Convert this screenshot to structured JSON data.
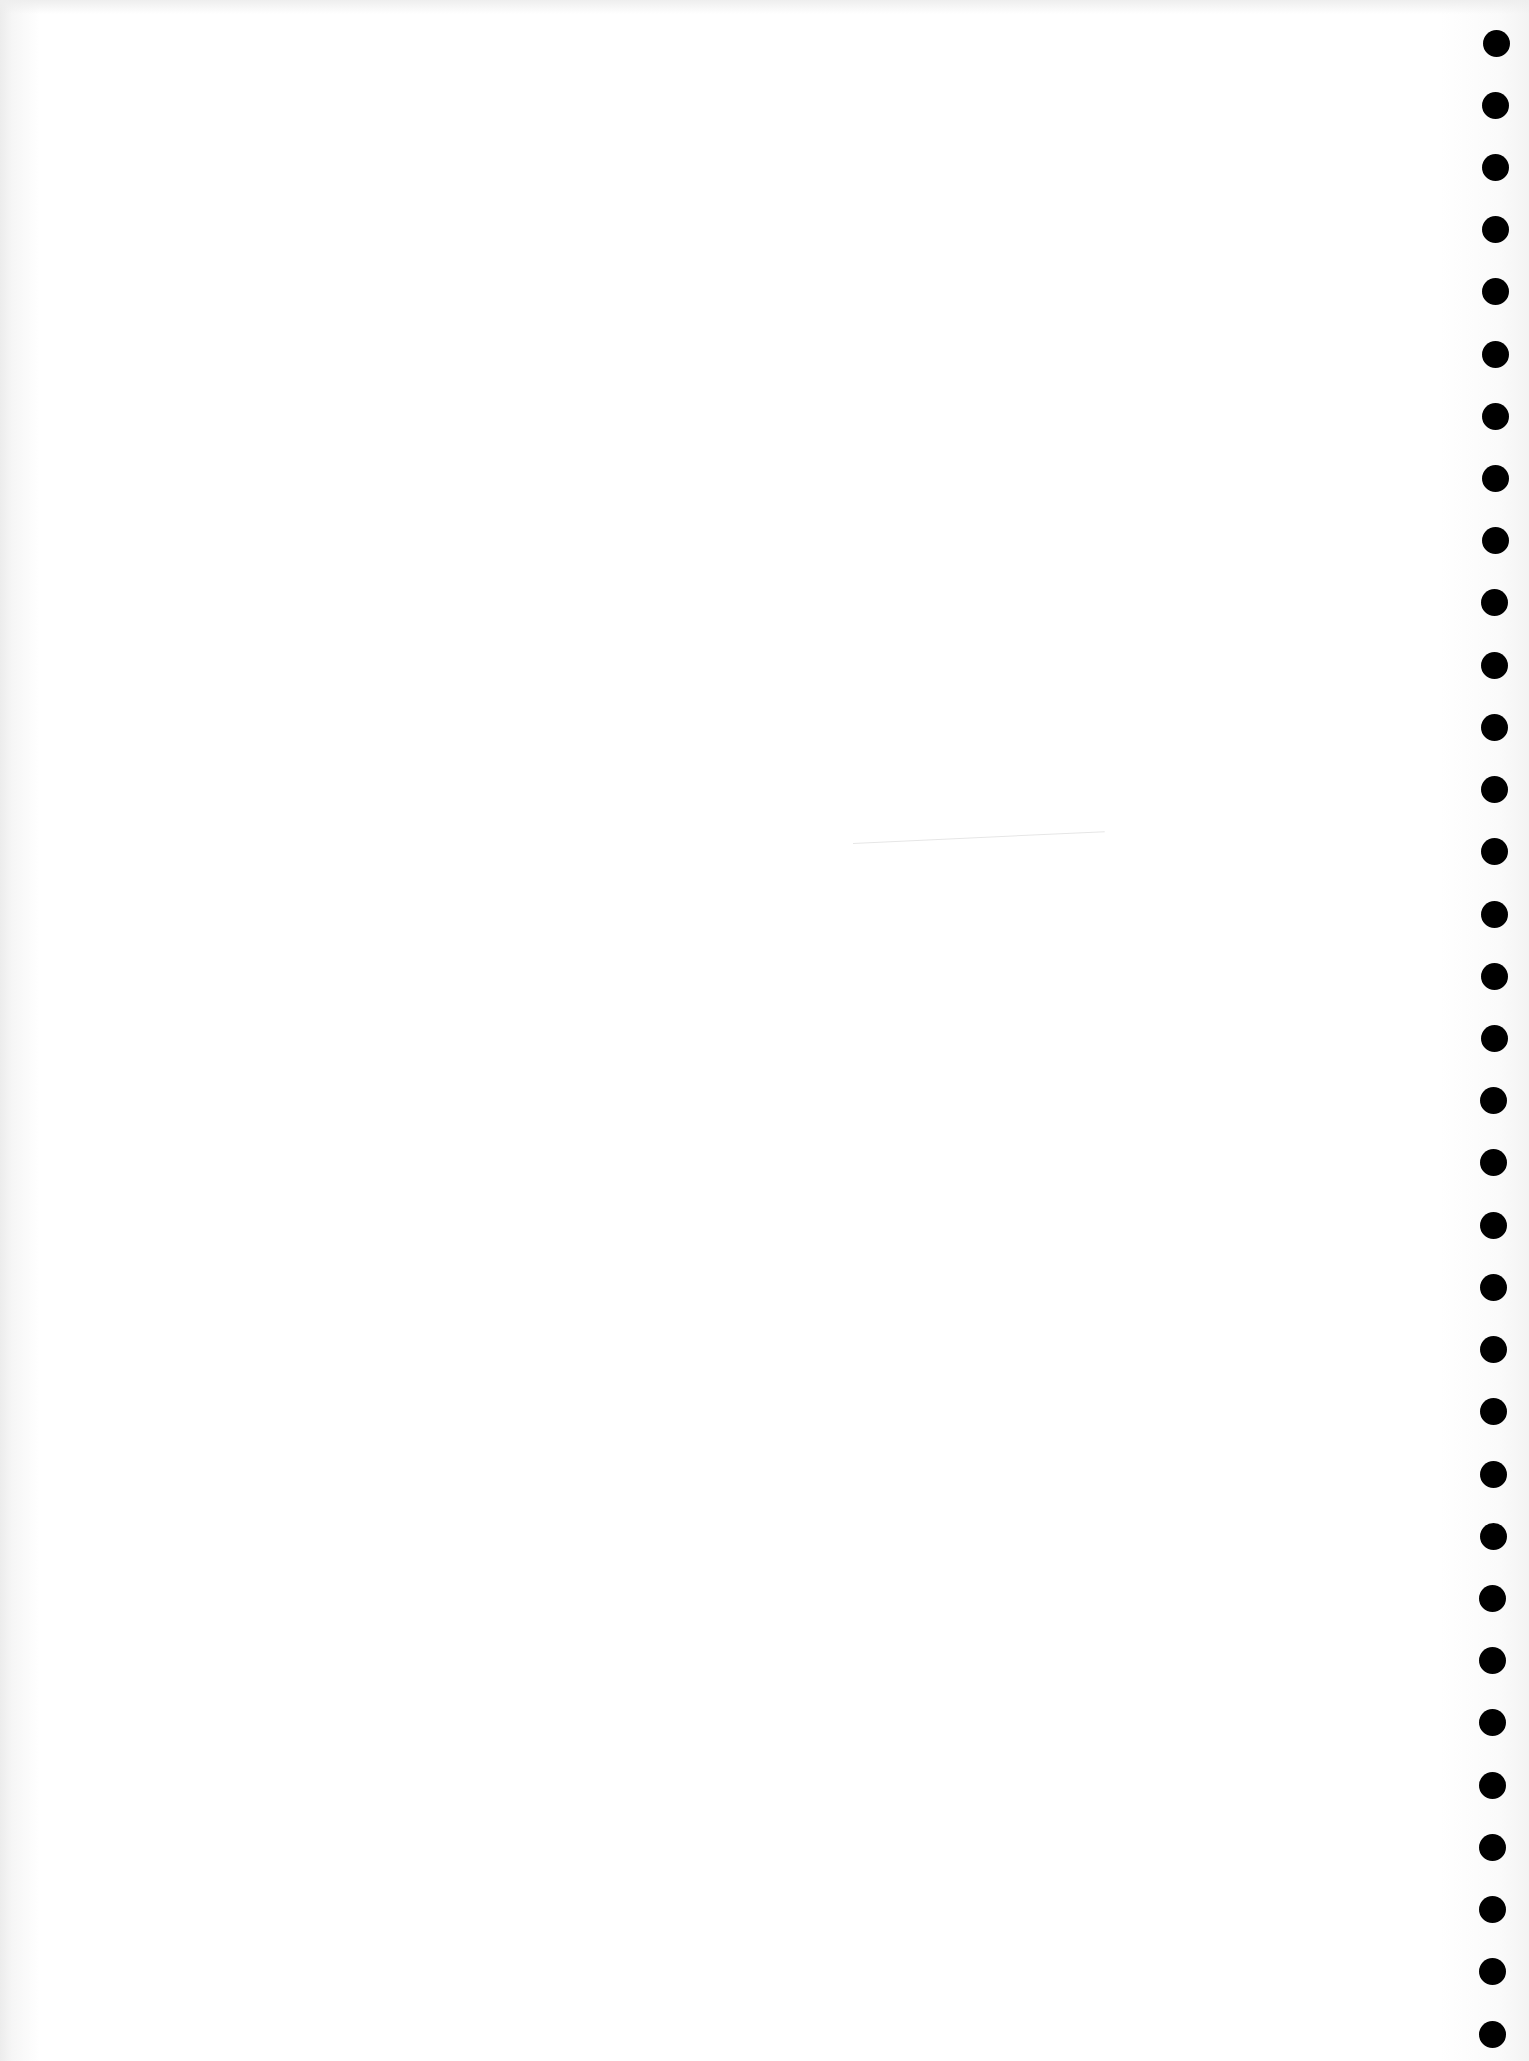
{
  "page": {
    "background_color": "#ffffff",
    "hole_color": "#000000"
  },
  "holes": {
    "count": 33,
    "diameter_px": 27,
    "first_center": {
      "x": 1496,
      "y": 43
    },
    "last_center": {
      "x": 1492,
      "y": 2034
    }
  },
  "marks": {
    "faint_line": {
      "x1": 853,
      "y1": 849,
      "x2": 1105,
      "y2": 837,
      "color": "#e6e6e6"
    }
  }
}
